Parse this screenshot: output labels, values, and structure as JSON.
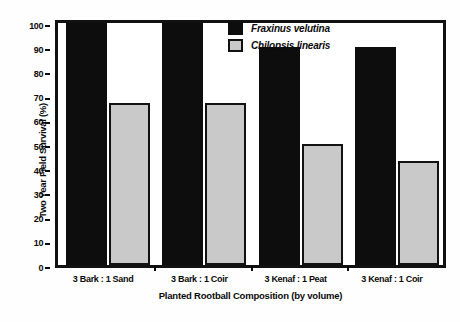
{
  "chart_data": {
    "type": "bar",
    "title": "",
    "xlabel": "Planted Rootball Composition (by volume)",
    "ylabel": "Two Year Field Survival (%)",
    "categories": [
      "3 Bark : 1 Sand",
      "3 Bark : 1 Coir",
      "3 Kenaf : 1 Peat",
      "3 Kenaf : 1 Coir"
    ],
    "series": [
      {
        "name": "Fraxinus velutina",
        "color": "#0d0d0d",
        "values": [
          100,
          100,
          90,
          90
        ]
      },
      {
        "name": "Chilopsis linearis",
        "color": "#c9c9c9",
        "values": [
          67,
          67,
          50,
          43
        ]
      }
    ],
    "ylim": [
      0,
      100
    ],
    "yticks": [
      0,
      10,
      20,
      30,
      40,
      50,
      60,
      70,
      80,
      90,
      100
    ],
    "ytick_labels": [
      "0",
      "10",
      "20",
      "30",
      "40",
      "50",
      "60",
      "70",
      "80",
      "90",
      "100"
    ],
    "grid": false,
    "legend_position": "top-right"
  }
}
